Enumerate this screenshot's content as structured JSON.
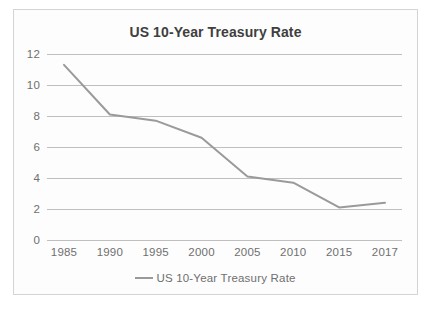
{
  "chart_data": {
    "type": "line",
    "title": "US 10-Year Treasury Rate",
    "xlabel": "",
    "ylabel": "",
    "x": [
      1985,
      1990,
      1995,
      2000,
      2005,
      2010,
      2015,
      2017
    ],
    "categories": [
      "1985",
      "1990",
      "1995",
      "2000",
      "2005",
      "2010",
      "2015",
      "2017"
    ],
    "series": [
      {
        "name": "US 10-Year Treasury Rate",
        "values": [
          11.3,
          8.1,
          7.7,
          6.6,
          4.1,
          3.7,
          2.1,
          2.4
        ],
        "color": "#9a9a9a"
      }
    ],
    "ylim": [
      0,
      12
    ],
    "yticks": [
      "0",
      "2",
      "4",
      "6",
      "8",
      "10",
      "12"
    ],
    "ytick_values": [
      0,
      2,
      4,
      6,
      8,
      10,
      12
    ],
    "grid": true,
    "legend": {
      "position": "bottom",
      "entries": [
        "US 10-Year Treasury Rate"
      ],
      "swatch": "line-swatch"
    },
    "markers": false,
    "gridline_color": "#bfbfbf",
    "tick_label_color": "#6f6f6f",
    "title_color": "#3f3f3f",
    "plot_background": "#fdfdfd",
    "border_color": "#d4d4d4"
  }
}
